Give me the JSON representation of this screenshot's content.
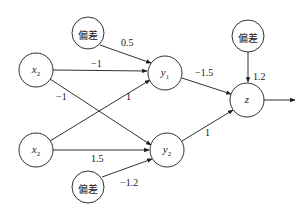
{
  "diagram": {
    "type": "neural-network",
    "nodes": [
      {
        "id": "x2_top",
        "label": "x",
        "sub": "2",
        "kind": "input",
        "cx": 36,
        "cy": 70
      },
      {
        "id": "x2_bottom",
        "label": "x",
        "sub": "2",
        "kind": "input",
        "cx": 36,
        "cy": 150
      },
      {
        "id": "bias_y1",
        "label": "偏差",
        "kind": "bias",
        "cx": 88,
        "cy": 33
      },
      {
        "id": "bias_y2",
        "label": "偏差",
        "kind": "bias",
        "cx": 88,
        "cy": 187
      },
      {
        "id": "y1",
        "label": "y",
        "sub": "1",
        "kind": "hidden",
        "cx": 165,
        "cy": 73
      },
      {
        "id": "y2",
        "label": "y",
        "sub": "2",
        "kind": "hidden",
        "cx": 167,
        "cy": 150
      },
      {
        "id": "bias_z",
        "label": "偏差",
        "kind": "bias",
        "cx": 248,
        "cy": 36
      },
      {
        "id": "z",
        "label": "z",
        "kind": "output",
        "cx": 247,
        "cy": 100
      }
    ],
    "edges": [
      {
        "from": "bias_y1",
        "to": "y1",
        "weight": "0.5"
      },
      {
        "from": "x2_top",
        "to": "y1",
        "weight": "−1"
      },
      {
        "from": "x2_top",
        "to": "y2",
        "weight": "−1"
      },
      {
        "from": "x2_bottom",
        "to": "y1",
        "weight": "1"
      },
      {
        "from": "x2_bottom",
        "to": "y2",
        "weight": "1.5"
      },
      {
        "from": "bias_y2",
        "to": "y2",
        "weight": "−1.2"
      },
      {
        "from": "y1",
        "to": "z",
        "weight": "−1.5"
      },
      {
        "from": "y2",
        "to": "z",
        "weight": "1"
      },
      {
        "from": "bias_z",
        "to": "z",
        "weight": "1.2"
      },
      {
        "from": "z",
        "to": "output",
        "weight": ""
      }
    ]
  },
  "labels": {
    "x2_top": {
      "main": "x",
      "sub": "2"
    },
    "x2_bottom": {
      "main": "x",
      "sub": "2"
    },
    "y1": {
      "main": "y",
      "sub": "1"
    },
    "y2": {
      "main": "y",
      "sub": "2"
    },
    "z": {
      "main": "z"
    },
    "bias_y1": "偏差",
    "bias_y2": "偏差",
    "bias_z": "偏差"
  },
  "weights": {
    "bias_y1_to_y1": "0.5",
    "x2top_to_y1": "−1",
    "x2top_to_y2": "−1",
    "x2bottom_to_y1": "1",
    "x2bottom_to_y2": "1.5",
    "bias_y2_to_y2": "−1.2",
    "y1_to_z": "−1.5",
    "y2_to_z": "1",
    "bias_z_to_z": "1.2"
  },
  "colors": {
    "stroke": "#1a1a1a",
    "background": "#ffffff"
  }
}
